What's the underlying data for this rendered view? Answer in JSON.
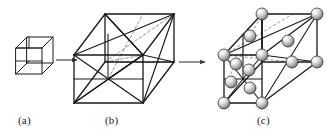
{
  "figure": {
    "caption_labels": [
      {
        "id": "a",
        "text": "(a)",
        "description": "small-unit-cube"
      },
      {
        "id": "b",
        "text": "(b)",
        "description": "cube-with-face-diagonals"
      },
      {
        "id": "c",
        "text": "(c)",
        "description": "cube-with-atom-spheres"
      }
    ],
    "background_color": "#ffffff",
    "line_color": "#1a1a1a",
    "dashed_line_color": "#8c8c8c",
    "sphere_fill_light": "#f2f2f2",
    "sphere_fill_mid": "#b8b8b8",
    "sphere_fill_dark": "#6e6e6e",
    "sphere_outline": "#2b2b2b",
    "arrow_color": "#3a3a3a",
    "panels": [
      {
        "name": "small-cube",
        "label": "(a)",
        "kind": "wireframe-cube",
        "solid_edges": 12,
        "internal_diagonals": 2
      },
      {
        "name": "large-cube-diagonals",
        "label": "(b)",
        "kind": "wireframe-cube-with-face-diagonals",
        "solid_edges": 12,
        "face_diagonals": 8,
        "dashed_hidden_lines": 5
      },
      {
        "name": "atom-structure",
        "label": "(c)",
        "kind": "cube-with-spheres",
        "sphere_count": 14,
        "sphere_radius_px": 6
      }
    ],
    "arrows": [
      {
        "name": "arrow-a-to-b",
        "from": "(a)",
        "to": "(b)"
      },
      {
        "name": "arrow-b-to-c",
        "from": "(b)",
        "to": "(c)"
      }
    ]
  }
}
